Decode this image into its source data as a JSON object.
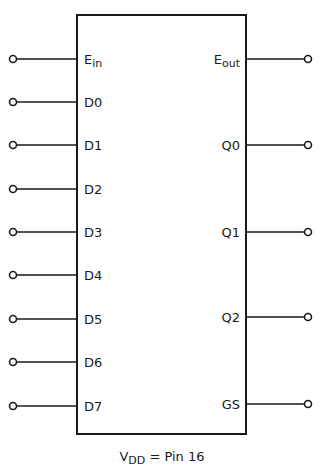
{
  "chip": {
    "box": {
      "x": 77,
      "y": 15,
      "width": 169,
      "height": 419
    },
    "stroke_color": "#1a1a1a"
  },
  "left_pins": [
    {
      "name": "E",
      "sub": "in",
      "y": 59
    },
    {
      "name": "D0",
      "sub": "",
      "y": 102
    },
    {
      "name": "D1",
      "sub": "",
      "y": 145
    },
    {
      "name": "D2",
      "sub": "",
      "y": 189
    },
    {
      "name": "D3",
      "sub": "",
      "y": 232
    },
    {
      "name": "D4",
      "sub": "",
      "y": 275
    },
    {
      "name": "D5",
      "sub": "",
      "y": 319
    },
    {
      "name": "D6",
      "sub": "",
      "y": 362
    },
    {
      "name": "D7",
      "sub": "",
      "y": 406
    }
  ],
  "right_pins": [
    {
      "name": "E",
      "sub": "out",
      "y": 59
    },
    {
      "name": "Q0",
      "sub": "",
      "y": 145
    },
    {
      "name": "Q1",
      "sub": "",
      "y": 232
    },
    {
      "name": "Q2",
      "sub": "",
      "y": 317
    },
    {
      "name": "GS",
      "sub": "",
      "y": 404
    }
  ],
  "caption": {
    "symbol": "V",
    "symbol_sub": "DD",
    "rest": " = Pin 16"
  }
}
